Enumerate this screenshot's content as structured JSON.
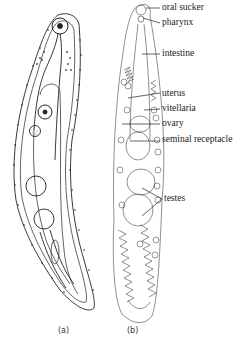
{
  "figure": {
    "panels": [
      {
        "id": "a",
        "label": "(a)"
      },
      {
        "id": "b",
        "label": "(b)"
      }
    ],
    "labels": [
      {
        "text": "oral sucker",
        "y": 2
      },
      {
        "text": "pharynx",
        "y": 17
      },
      {
        "text": "intestine",
        "y": 48
      },
      {
        "text": "uterus",
        "y": 88
      },
      {
        "text": "vitellaria",
        "y": 103
      },
      {
        "text": "ovary",
        "y": 118
      },
      {
        "text": "seminal receptacle",
        "y": 134
      },
      {
        "text": "testes",
        "y": 193
      }
    ]
  }
}
